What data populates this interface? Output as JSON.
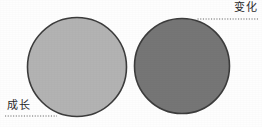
{
  "figure": {
    "background_color": "#fefefe",
    "shapes": [
      {
        "name": "left-circle",
        "role": "growth-circle",
        "cx": 77,
        "cy": 67,
        "r": 49.5,
        "fill": "#b3b3b3",
        "stroke": "#3c3c3c",
        "stroke_width": 1.6
      },
      {
        "name": "right-circle",
        "role": "change-circle",
        "cx": 182,
        "cy": 66,
        "r": 47.5,
        "fill": "#767676",
        "stroke": "#3c3c3c",
        "stroke_width": 1.6
      }
    ],
    "leaders": [
      {
        "name": "change-leader",
        "x1": 258,
        "y1": 19,
        "x2": 196,
        "y2": 19,
        "color": "#555555",
        "style": "dotted"
      },
      {
        "name": "growth-leader",
        "x1": 5,
        "y1": 116,
        "x2": 57,
        "y2": 116,
        "color": "#555555",
        "style": "dotted"
      }
    ]
  },
  "labels": {
    "change": "变化",
    "growth": "成长",
    "text_color": "#2a2a2a"
  }
}
